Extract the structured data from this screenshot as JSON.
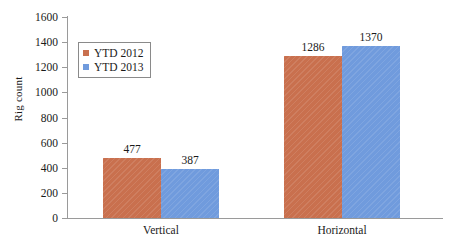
{
  "chart_data": {
    "type": "bar",
    "title": "",
    "subtitle": "",
    "xlabel": "",
    "ylabel": "Rig count",
    "categories": [
      "Vertical",
      "Horizontal"
    ],
    "series": [
      {
        "name": "YTD 2012",
        "color": "#c9704e",
        "values": [
          477,
          1286
        ]
      },
      {
        "name": "YTD 2013",
        "color": "#709bdd",
        "values": [
          387,
          1370
        ]
      }
    ],
    "ylim": [
      0,
      1600
    ],
    "ytick_step": 200,
    "yticks": [
      0,
      200,
      400,
      600,
      800,
      1000,
      1200,
      1400,
      1600
    ],
    "ytick_labels": [
      "0",
      "200",
      "400",
      "600",
      "800",
      "1000",
      "1200",
      "1400",
      "1600"
    ],
    "grid": false,
    "legend_position": "upper-left-inside",
    "data_labels": true,
    "annotations": []
  },
  "legend": {
    "items": [
      {
        "label": "YTD 2012",
        "color": "#c9704e"
      },
      {
        "label": "YTD 2013",
        "color": "#709bdd"
      }
    ]
  },
  "axis": {
    "y_title": "Rig count",
    "axis_color": "#9a9a9a"
  }
}
